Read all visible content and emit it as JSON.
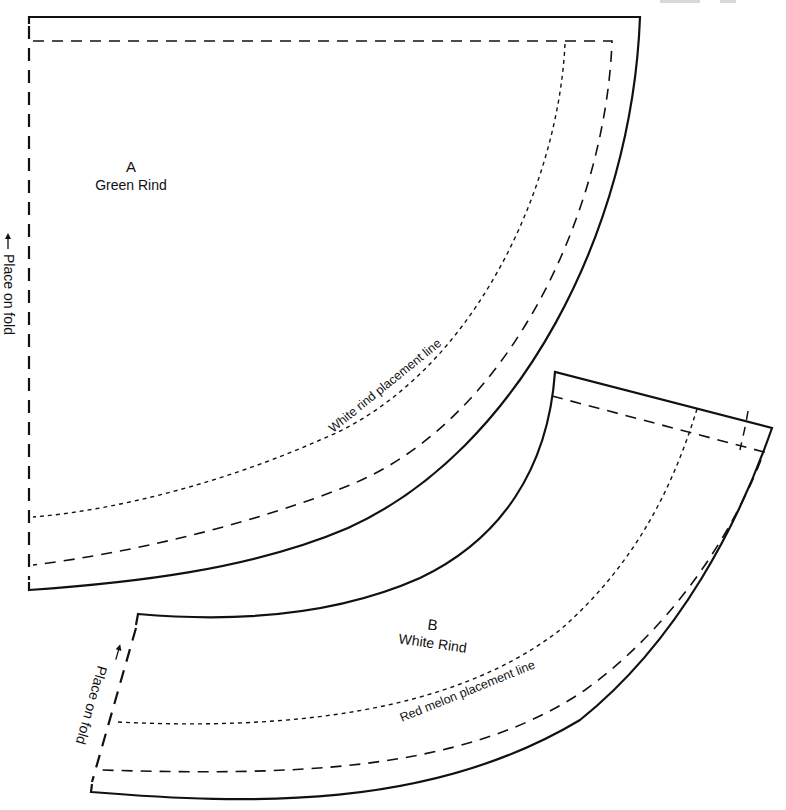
{
  "sheet": {
    "header_fragment": "Glitter · 31",
    "colors": {
      "ink": "#111111",
      "paper": "#ffffff"
    }
  },
  "piece_a": {
    "letter": "A",
    "name": "Green Rind",
    "placement_line_label": "White rind placement line",
    "fold_label": "Place on fold",
    "fold_arrow_icon": "arrow-up-icon"
  },
  "piece_b": {
    "letter": "B",
    "name": "White Rind",
    "placement_line_label": "Red melon placement line",
    "fold_label": "Place on fold",
    "fold_arrow_icon": "arrow-up-icon"
  },
  "legend": {
    "solid": "cutting line",
    "long_dash": "seam line / fold line",
    "dotted": "placement line"
  }
}
